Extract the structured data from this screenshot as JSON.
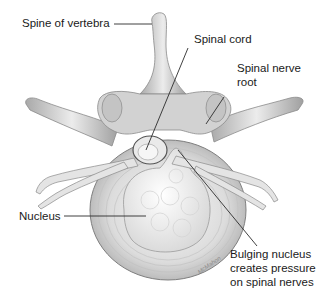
{
  "figure": {
    "labels": {
      "spine": "Spine of vertebra",
      "cord": "Spinal cord",
      "nerve_root_line1": "Spinal nerve",
      "nerve_root_line2": "root",
      "nucleus": "Nucleus",
      "bulging_line1": "Bulging nucleus",
      "bulging_line2": "creates pressure",
      "bulging_line3": "on spinal nerves"
    },
    "artist_signature": "McMahon",
    "caption_partial": "",
    "colors": {
      "background": "#ffffff",
      "bone": "#d9d9d9",
      "bone_shadow": "#9e9e9e",
      "disc": "#e6e6e6",
      "nucleus": "#f4f4f4",
      "leader_line": "#2b2b2b",
      "text": "#1a1a1a"
    }
  }
}
